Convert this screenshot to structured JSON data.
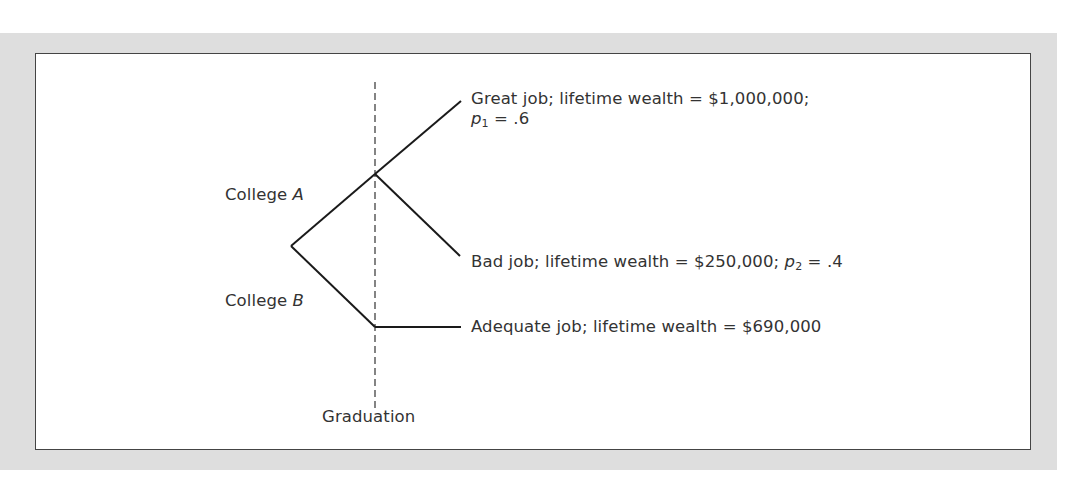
{
  "diagram": {
    "type": "decision-tree",
    "timeline_marker": {
      "label": "Graduation"
    },
    "decisions": [
      {
        "label_prefix": "College ",
        "label_var": "A"
      },
      {
        "label_prefix": "College ",
        "label_var": "B"
      }
    ],
    "outcomes": [
      {
        "name": "great-job",
        "branch": "A",
        "text": "Great job; lifetime wealth = $1,000,000;",
        "prob_var": "p",
        "prob_sub": "1",
        "prob_value": " = .6"
      },
      {
        "name": "bad-job",
        "branch": "A",
        "text": "Bad job; lifetime wealth = $250,000; ",
        "prob_var": "p",
        "prob_sub": "2",
        "prob_value": " = .4"
      },
      {
        "name": "adequate-job",
        "branch": "B",
        "text": "Adequate job; lifetime wealth = $690,000"
      }
    ],
    "colors": {
      "frame": "#dedede",
      "panel_border": "#444444",
      "lines": "#1a1a1a",
      "text": "#333333"
    }
  }
}
